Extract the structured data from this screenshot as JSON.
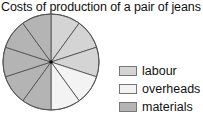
{
  "chart_data": {
    "type": "pie",
    "title": "Costs of production of a pair of jeans",
    "sectors_total": 10,
    "categories": [
      "labour",
      "overheads",
      "materials"
    ],
    "values": [
      30,
      20,
      50
    ],
    "sector_counts": [
      3,
      2,
      5
    ],
    "colors": [
      "#d4d4d4",
      "#f3f3f3",
      "#b4b4b4"
    ],
    "start_angle": "12 o'clock, clockwise",
    "legend_position": "right"
  },
  "title": "Costs of production of a pair of jeans",
  "legend": [
    {
      "label": "labour",
      "color": "#d4d4d4"
    },
    {
      "label": "overheads",
      "color": "#f3f3f3"
    },
    {
      "label": "materials",
      "color": "#b4b4b4"
    }
  ]
}
